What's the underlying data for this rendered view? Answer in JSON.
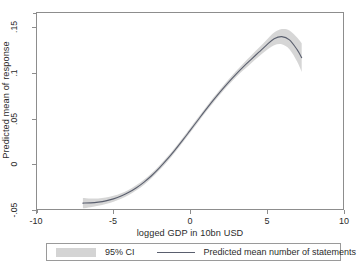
{
  "chart_data": {
    "type": "line",
    "title": "",
    "subtitle": "",
    "xlabel": "logged GDP in 10bn USD",
    "ylabel": "Predicted mean of response",
    "xlim": [
      -10,
      10
    ],
    "ylim": [
      -0.05,
      0.1665
    ],
    "xticks": [
      -10,
      -5,
      0,
      5,
      10
    ],
    "xtick_labels": [
      "-10",
      "-5",
      "0",
      "5",
      "10"
    ],
    "yticks": [
      -0.05,
      0,
      0.05,
      0.1,
      0.15
    ],
    "ytick_labels": [
      "-.05",
      "0",
      ".05",
      ".1",
      ".15"
    ],
    "grid": false,
    "legend_position": "below-plot",
    "series": [
      {
        "name": "Predicted mean number of statements",
        "type": "line",
        "color": "#5a5f6e",
        "x": [
          -7.0,
          -6.5,
          -6.0,
          -5.5,
          -5.0,
          -4.5,
          -4.0,
          -3.5,
          -3.0,
          -2.5,
          -2.0,
          -1.5,
          -1.0,
          -0.5,
          0.0,
          0.5,
          1.0,
          1.5,
          2.0,
          2.5,
          3.0,
          3.5,
          4.0,
          4.5,
          5.0,
          5.5,
          6.0,
          6.5,
          7.0,
          7.3
        ],
        "values": [
          -0.0435,
          -0.0432,
          -0.0424,
          -0.041,
          -0.0388,
          -0.0357,
          -0.0316,
          -0.0265,
          -0.0203,
          -0.013,
          -0.0046,
          0.0047,
          0.0148,
          0.0255,
          0.0366,
          0.0478,
          0.0589,
          0.0697,
          0.08,
          0.0897,
          0.0988,
          0.1073,
          0.1153,
          0.1232,
          0.1311,
          0.138,
          0.1404,
          0.1369,
          0.1261,
          0.1172
        ]
      },
      {
        "name": "95% CI",
        "type": "band",
        "color": "#d4d4d4",
        "x": [
          -7.0,
          -6.5,
          -6.0,
          -5.5,
          -5.0,
          -4.5,
          -4.0,
          -3.5,
          -3.0,
          -2.5,
          -2.0,
          -1.5,
          -1.0,
          -0.5,
          0.0,
          0.5,
          1.0,
          1.5,
          2.0,
          2.5,
          3.0,
          3.5,
          4.0,
          4.5,
          5.0,
          5.5,
          6.0,
          6.5,
          7.0,
          7.3
        ],
        "lower": [
          -0.0492,
          -0.048,
          -0.0465,
          -0.0446,
          -0.0421,
          -0.0388,
          -0.0346,
          -0.0294,
          -0.0231,
          -0.0157,
          -0.0073,
          0.002,
          0.0121,
          0.0228,
          0.0339,
          0.0451,
          0.0562,
          0.0669,
          0.0771,
          0.0866,
          0.0954,
          0.1035,
          0.1111,
          0.1184,
          0.1254,
          0.131,
          0.132,
          0.1265,
          0.1128,
          0.1013
        ],
        "upper": [
          -0.0378,
          -0.0384,
          -0.0383,
          -0.0374,
          -0.0355,
          -0.0326,
          -0.0286,
          -0.0236,
          -0.0175,
          -0.0103,
          -0.0019,
          0.0074,
          0.0175,
          0.0282,
          0.0393,
          0.0505,
          0.0616,
          0.0725,
          0.0829,
          0.0928,
          0.1022,
          0.1111,
          0.1195,
          0.128,
          0.1368,
          0.145,
          0.1488,
          0.1473,
          0.1394,
          0.1331
        ]
      }
    ]
  },
  "axes": {
    "y_title": "Predicted mean of response",
    "x_title": "logged GDP in 10bn USD",
    "y_tick_labels": [
      ".15",
      ".1",
      ".05",
      "0",
      "-.05"
    ],
    "x_tick_labels": [
      "-10",
      "-5",
      "0",
      "5",
      "10"
    ]
  },
  "legend": {
    "ci_label": "95% CI",
    "line_label": "Predicted mean number of statements"
  },
  "colors": {
    "line": "#5a5f6e",
    "band": "#d4d4d4",
    "frame": "#8d8d8d",
    "text": "#2b2b2b",
    "background": "#ffffff"
  }
}
